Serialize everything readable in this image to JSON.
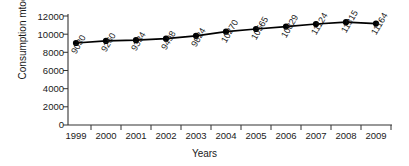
{
  "chart_data": {
    "type": "line",
    "title": "",
    "xlabel": "Years",
    "ylabel": "Consumption mtoe",
    "categories": [
      "1999",
      "2000",
      "2001",
      "2002",
      "2003",
      "2004",
      "2005",
      "2006",
      "2007",
      "2008",
      "2009"
    ],
    "values": [
      9030,
      9260,
      9334,
      9498,
      9824,
      10270,
      10565,
      10829,
      11124,
      11315,
      11164
    ],
    "point_labels": [
      "9030",
      "9260",
      "9334",
      "9498",
      "9824",
      "10270",
      "10565",
      "10829",
      "11124",
      "11315",
      "11164"
    ],
    "ylim": [
      0,
      12000
    ],
    "ytick_labels": [
      "0",
      "2000",
      "4000",
      "6000",
      "8000",
      "10000",
      "12000"
    ],
    "ytick_values": [
      0,
      2000,
      4000,
      6000,
      8000,
      10000,
      12000
    ],
    "grid": false,
    "legend": "none",
    "series_color": "#000000",
    "marker": "circle-filled",
    "axis_color": "#333333",
    "background": "#ffffff"
  }
}
